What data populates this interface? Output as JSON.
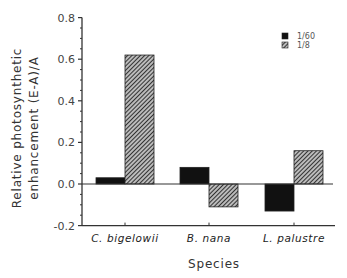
{
  "chart_data": {
    "type": "bar",
    "title": "",
    "xlabel": "Species",
    "ylabel": [
      "Relative photosynthetic",
      "enhancement (E-A)/A"
    ],
    "categories": [
      "C. bigelowii",
      "B. nana",
      "L. palustre"
    ],
    "series": [
      {
        "name": "1/60",
        "fill": "solid-black",
        "values": [
          0.03,
          0.08,
          -0.13
        ]
      },
      {
        "name": "1/8",
        "fill": "diagonal-hatch",
        "values": [
          0.62,
          -0.11,
          0.16
        ]
      }
    ],
    "ylim": [
      -0.2,
      0.8
    ],
    "yticks": [
      -0.2,
      0.0,
      0.2,
      0.4,
      0.6,
      0.8
    ],
    "ytick_labels": [
      "-0.2",
      "0.0",
      "0.2",
      "0.4",
      "0.6",
      "0.8"
    ],
    "grid": false,
    "legend_position": "upper right",
    "zero_line": true
  },
  "colors": {
    "bar_solid": "#111111",
    "hatch": "#555555",
    "axis": "#333333"
  }
}
